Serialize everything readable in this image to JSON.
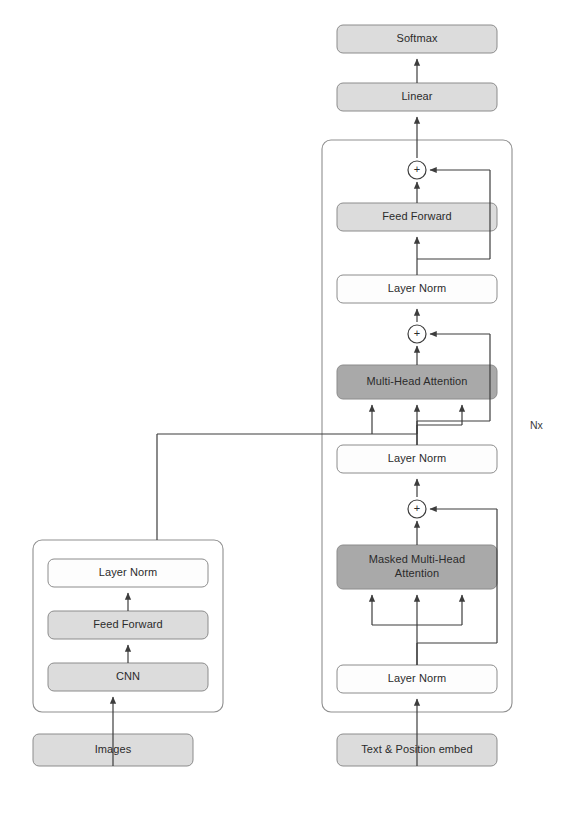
{
  "diagram": {
    "colors": {
      "box_light_fill": "#dcdcdc",
      "box_dark_fill": "#a9a9a9",
      "box_white_fill": "#fdfdfd",
      "box_stroke": "#8c8c8c",
      "frame_stroke": "#8f8f8f",
      "line": "#3d3d3d",
      "text": "#2b2b2b",
      "background": "#ffffff"
    },
    "encoder_branch": {
      "name": "image-encoder",
      "input": {
        "label": "Images",
        "style": "light"
      },
      "blocks": [
        {
          "label": "CNN",
          "style": "light"
        },
        {
          "label": "Feed Forward",
          "style": "light"
        },
        {
          "label": "Layer Norm",
          "style": "white"
        }
      ]
    },
    "decoder_branch": {
      "name": "text-decoder",
      "repeat_label": "Nx",
      "input": {
        "label": "Text & Position embed",
        "style": "light"
      },
      "blocks": [
        {
          "label": "Layer Norm",
          "style": "white"
        },
        {
          "label": "Masked Multi-Head Attention",
          "line1": "Masked Multi-Head",
          "line2": "Attention",
          "style": "dark"
        },
        {
          "label": "Layer Norm",
          "style": "white"
        },
        {
          "label": "Multi-Head Attention",
          "style": "dark"
        },
        {
          "label": "Layer Norm",
          "style": "white"
        },
        {
          "label": "Feed Forward",
          "style": "light"
        }
      ],
      "add_nodes": [
        {
          "label": "+",
          "name": "add-residual-masked-attention"
        },
        {
          "label": "+",
          "name": "add-residual-cross-attention"
        },
        {
          "label": "+",
          "name": "add-residual-feed-forward"
        }
      ]
    },
    "output_head": [
      {
        "label": "Linear",
        "style": "light"
      },
      {
        "label": "Softmax",
        "style": "light"
      }
    ]
  }
}
